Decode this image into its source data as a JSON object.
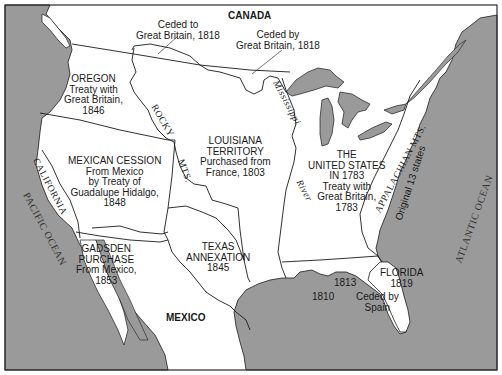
{
  "map": {
    "colors": {
      "water": "#9a9a9a",
      "land": "#ffffff",
      "border": "#1a1a1a",
      "frame": "#2a2a2a",
      "text": "#1a1a1a"
    },
    "labels": {
      "canada": "CANADA",
      "ceded_to_gb": [
        "Ceded to",
        "Great Britain, 1818"
      ],
      "ceded_by_gb": [
        "Ceded by",
        "Great Britain, 1818"
      ],
      "oregon": {
        "title": "OREGON",
        "lines": [
          "Treaty with",
          "Great Britain,",
          "1846"
        ]
      },
      "louisiana": {
        "title_lines": [
          "LOUISIANA",
          "TERRITORY"
        ],
        "lines": [
          "Purchased from",
          "France, 1803"
        ]
      },
      "mexican_cession": {
        "title": "MEXICAN CESSION",
        "lines": [
          "From Mexico",
          "by Treaty of",
          "Guadalupe Hidalgo,",
          "1848"
        ]
      },
      "us_1783": {
        "title_lines": [
          "THE",
          "UNITED STATES",
          "IN 1783"
        ],
        "lines": [
          "Treaty with",
          "Great Britain,",
          "1783"
        ]
      },
      "gadsden": {
        "title_lines": [
          "GADSDEN",
          "PURCHASE"
        ],
        "lines": [
          "From Mexico,",
          "1853"
        ]
      },
      "texas": {
        "title_lines": [
          "TEXAS",
          "ANNEXATION"
        ],
        "year": "1845"
      },
      "florida": {
        "title": "FLORIDA",
        "year": "1819",
        "ceded_lines": [
          "Ceded by",
          "Spain"
        ]
      },
      "gulf_1810": "1810",
      "gulf_1813": "1813",
      "mexico": "MEXICO",
      "pacific_ocean": "PACIFIC OCEAN",
      "atlantic_ocean": "ATLANTIC OCEAN",
      "california": "CALIFORNIA",
      "rocky": "ROCKY",
      "mts": "MTS.",
      "mississippi": "Mississippi",
      "river": "River",
      "appalachian": "APPALACHIAN MTS.",
      "original_13": "Original 13 states"
    }
  }
}
